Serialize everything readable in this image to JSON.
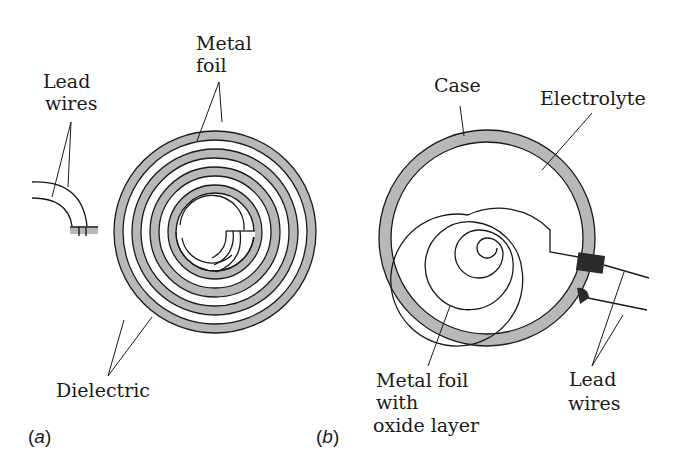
{
  "figure": {
    "panel_a": {
      "label_open": "(",
      "label_letter": "a",
      "label_close": ")",
      "title": "Rolled foil capacitor",
      "labels": {
        "lead_wires_line1": "Lead",
        "lead_wires_line2": "wires",
        "metal_foil_line1": "Metal",
        "metal_foil_line2": "foil",
        "dielectric": "Dielectric"
      }
    },
    "panel_b": {
      "label_open": "(",
      "label_letter": "b",
      "label_close": ")",
      "title": "Electrolytic capacitor",
      "labels": {
        "case": "Case",
        "electrolyte": "Electrolyte",
        "metal_foil_line1": "Metal foil",
        "metal_foil_line2": "with",
        "metal_foil_line3": "oxide layer",
        "lead_wires_line1": "Lead",
        "lead_wires_line2": "wires"
      }
    },
    "colors": {
      "foil_fill": "#b8b8b8",
      "stroke": "#1a1a1a",
      "background": "#ffffff",
      "terminal": "#2a2a2a"
    }
  }
}
